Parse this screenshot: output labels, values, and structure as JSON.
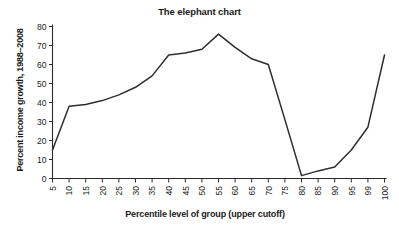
{
  "chart_data": {
    "type": "line",
    "title": "The elephant chart",
    "xlabel": "Percentile level of group (upper cutoff)",
    "ylabel": "Percent income growth, 1988–2008",
    "categories": [
      "5",
      "10",
      "15",
      "20",
      "25",
      "30",
      "35",
      "40",
      "45",
      "50",
      "55",
      "60",
      "65",
      "70",
      "75",
      "80",
      "85",
      "90",
      "95",
      "99",
      "100"
    ],
    "values": [
      15,
      38,
      39,
      41,
      44,
      48,
      54,
      65,
      66,
      68,
      76,
      69,
      63,
      60,
      31,
      1.5,
      4,
      6,
      15,
      27,
      65
    ],
    "series": [
      {
        "name": "Percent income growth, 1988–2008",
        "values": [
          15,
          38,
          39,
          41,
          44,
          48,
          54,
          65,
          66,
          68,
          76,
          69,
          63,
          60,
          31,
          1.5,
          4,
          6,
          15,
          27,
          65
        ]
      }
    ],
    "ylim": [
      0,
      80
    ],
    "yticks": [
      0,
      10,
      20,
      30,
      40,
      50,
      60,
      70,
      80
    ],
    "ytick_labels": [
      "0",
      "10",
      "20",
      "30",
      "40",
      "50",
      "60",
      "70",
      "80"
    ],
    "grid": false,
    "legend": false,
    "legend_position": "none",
    "line_color": "#2e2e2e",
    "background_color": "#ffffff",
    "xtick_label_rotation": -90
  }
}
